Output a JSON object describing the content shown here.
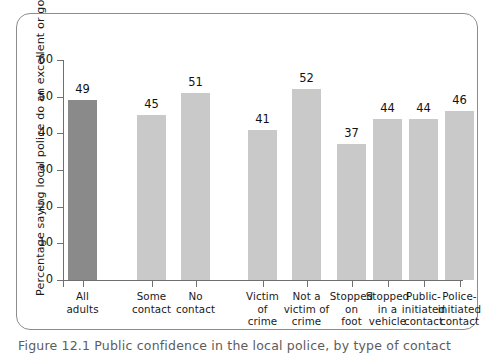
{
  "chart_data": {
    "type": "bar",
    "title": "",
    "xlabel": "",
    "ylabel": "Percentage saying local police do an excellent or good job",
    "ylim": [
      0,
      60
    ],
    "yticks": [
      0,
      10,
      20,
      30,
      40,
      50,
      60
    ],
    "grid": false,
    "legend": null,
    "categories": [
      "All adults",
      "Some contact",
      "No contact",
      "Victim of crime",
      "Not a victim of crime",
      "Stopped on foot",
      "Stopped in a vehicle",
      "Public-initiated contact",
      "Police-initiated contact"
    ],
    "values": [
      49,
      45,
      51,
      41,
      52,
      37,
      44,
      44,
      46
    ],
    "bar_colors": [
      "#8a8a8a",
      "#c9c9c9",
      "#c9c9c9",
      "#c9c9c9",
      "#c9c9c9",
      "#c9c9c9",
      "#c9c9c9",
      "#c9c9c9",
      "#c9c9c9"
    ]
  },
  "axis": {
    "y_title": "Percentage saying local police do an excellent or good job",
    "tick_labels": [
      "60",
      "50",
      "40",
      "30",
      "20",
      "10",
      "0"
    ]
  },
  "x_labels": [
    [
      "All",
      "adults"
    ],
    [
      "Some",
      "contact"
    ],
    [
      "No",
      "contact"
    ],
    [
      "Victim",
      "of",
      "crime"
    ],
    [
      "Not a",
      "victim of",
      "crime"
    ],
    [
      "Stopped",
      "on",
      "foot"
    ],
    [
      "Stopped",
      "in a",
      "vehicle"
    ],
    [
      "Public-",
      "initiated",
      "contact"
    ],
    [
      "Police-",
      "initiated",
      "contact"
    ]
  ],
  "bar_values": [
    "49",
    "45",
    "51",
    "41",
    "52",
    "37",
    "44",
    "44",
    "46"
  ],
  "caption": "Figure 12.1  Public confidence in the local police, by type of contact"
}
